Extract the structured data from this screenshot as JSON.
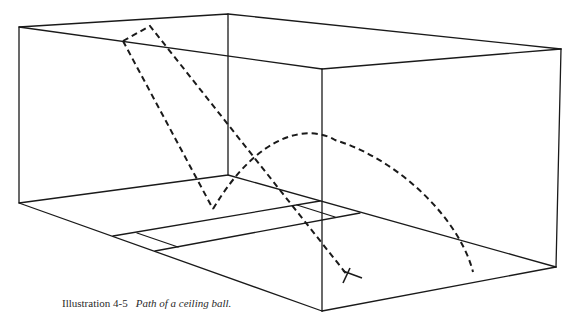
{
  "figure": {
    "label": "Illustration 4-5",
    "title": "Path of a ceiling ball.",
    "elements": {
      "court_box": "wireframe-court",
      "ball_path": "dashed-ceiling-ball-path",
      "landing_mark": "X",
      "floor_lines": [
        "service-line",
        "short-line",
        "service-box"
      ]
    },
    "colors": {
      "line": "#1a1a1a",
      "background": "#ffffff"
    }
  }
}
